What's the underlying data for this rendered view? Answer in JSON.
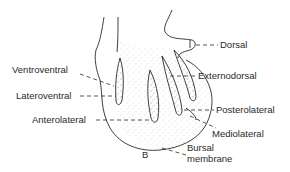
{
  "diagram": {
    "labels": {
      "dorsal": "Dorsal",
      "externodorsal": "Externodorsal",
      "ventroventral": "Ventroventral",
      "lateroventral": "Lateroventral",
      "anterolateral": "Anterolateral",
      "posterolateral": "Posterolateral",
      "mediolateral": "Mediolateral",
      "bursal_line1": "Bursal",
      "bursal_line2": "membrane",
      "panel_letter": "B"
    },
    "colors": {
      "ink": "#2a2a2a",
      "background": "#ffffff"
    }
  }
}
